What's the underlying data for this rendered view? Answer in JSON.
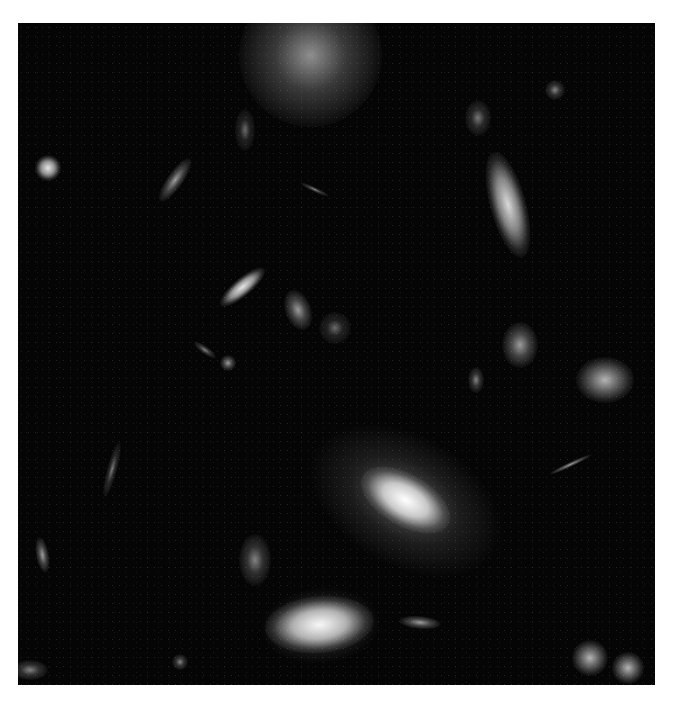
{
  "image": {
    "subject": "deep field of galaxies",
    "background_color": "#050505",
    "page_background": "#ffffff",
    "frame": {
      "x": 18,
      "y": 23,
      "width": 637,
      "height": 662
    }
  },
  "galaxies": [
    {
      "x": 310,
      "y": 55,
      "rx": 55,
      "ry": 55,
      "rot": 0,
      "b": 0.55,
      "name": "spiral-galaxy-top"
    },
    {
      "x": 405,
      "y": 500,
      "rx": 38,
      "ry": 20,
      "rot": 30,
      "b": 1.0,
      "halo": 95,
      "name": "elliptical-galaxy-center"
    },
    {
      "x": 320,
      "y": 625,
      "rx": 42,
      "ry": 22,
      "rot": -5,
      "b": 0.95,
      "halo": 55,
      "name": "bright-galaxy-bottom"
    },
    {
      "x": 508,
      "y": 205,
      "rx": 14,
      "ry": 42,
      "rot": -15,
      "b": 0.85,
      "name": "edge-on-galaxy-right"
    },
    {
      "x": 243,
      "y": 287,
      "rx": 22,
      "ry": 7,
      "rot": -40,
      "b": 0.9,
      "name": "elongated-galaxy-left"
    },
    {
      "x": 48,
      "y": 168,
      "rx": 10,
      "ry": 10,
      "rot": 0,
      "b": 0.9,
      "name": "compact-galaxy-left"
    },
    {
      "x": 605,
      "y": 380,
      "rx": 22,
      "ry": 18,
      "rot": 0,
      "b": 0.7,
      "name": "galaxy-pair-right"
    },
    {
      "x": 520,
      "y": 345,
      "rx": 14,
      "ry": 18,
      "rot": 0,
      "b": 0.6,
      "name": "galaxy-mid-right"
    },
    {
      "x": 298,
      "y": 310,
      "rx": 10,
      "ry": 16,
      "rot": -20,
      "b": 0.6,
      "name": "galaxy-mid"
    },
    {
      "x": 335,
      "y": 328,
      "rx": 12,
      "ry": 12,
      "rot": 0,
      "b": 0.4,
      "name": "galaxy-mid-2"
    },
    {
      "x": 255,
      "y": 560,
      "rx": 12,
      "ry": 20,
      "rot": 0,
      "b": 0.5,
      "name": "galaxy-bottom-left"
    },
    {
      "x": 590,
      "y": 658,
      "rx": 14,
      "ry": 14,
      "rot": 0,
      "b": 0.7,
      "name": "galaxy-bottom-right-1"
    },
    {
      "x": 628,
      "y": 668,
      "rx": 12,
      "ry": 12,
      "rot": 0,
      "b": 0.7,
      "name": "galaxy-bottom-right-2"
    },
    {
      "x": 175,
      "y": 180,
      "rx": 20,
      "ry": 6,
      "rot": -55,
      "b": 0.6,
      "name": "galaxy-upper-left"
    },
    {
      "x": 478,
      "y": 118,
      "rx": 10,
      "ry": 14,
      "rot": 0,
      "b": 0.45,
      "name": "galaxy-upper-right"
    },
    {
      "x": 42,
      "y": 555,
      "rx": 5,
      "ry": 14,
      "rot": -10,
      "b": 0.6,
      "name": "galaxy-left-edge"
    },
    {
      "x": 112,
      "y": 470,
      "rx": 4,
      "ry": 22,
      "rot": 15,
      "b": 0.45,
      "name": "galaxy-streak-left"
    },
    {
      "x": 420,
      "y": 622,
      "rx": 16,
      "ry": 5,
      "rot": 5,
      "b": 0.6,
      "name": "galaxy-streak-bottom"
    },
    {
      "x": 570,
      "y": 465,
      "rx": 18,
      "ry": 2,
      "rot": -25,
      "b": 0.6,
      "name": "galaxy-streak-right"
    },
    {
      "x": 245,
      "y": 130,
      "rx": 8,
      "ry": 16,
      "rot": 0,
      "b": 0.4,
      "name": "galaxy-upper-mid"
    },
    {
      "x": 555,
      "y": 90,
      "rx": 8,
      "ry": 8,
      "rot": 0,
      "b": 0.5,
      "name": "galaxy-top-right"
    },
    {
      "x": 476,
      "y": 380,
      "rx": 6,
      "ry": 10,
      "rot": 0,
      "b": 0.5,
      "name": "galaxy-mid-right-2"
    },
    {
      "x": 228,
      "y": 363,
      "rx": 6,
      "ry": 6,
      "rot": 0,
      "b": 0.6,
      "name": "galaxy-small-ring"
    },
    {
      "x": 205,
      "y": 350,
      "rx": 10,
      "ry": 3,
      "rot": 35,
      "b": 0.5,
      "name": "galaxy-small-streak"
    },
    {
      "x": 180,
      "y": 662,
      "rx": 6,
      "ry": 6,
      "rot": 0,
      "b": 0.5,
      "name": "galaxy-bottom-small"
    },
    {
      "x": 30,
      "y": 670,
      "rx": 14,
      "ry": 8,
      "rot": 0,
      "b": 0.5,
      "name": "galaxy-bottom-left-edge"
    },
    {
      "x": 315,
      "y": 190,
      "rx": 12,
      "ry": 2,
      "rot": 25,
      "b": 0.5,
      "name": "galaxy-thin-streak"
    }
  ]
}
